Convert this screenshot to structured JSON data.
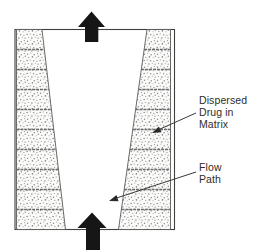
{
  "figure": {
    "labels": {
      "dispersed_drug": {
        "line1": "Dispersed",
        "line2": "Drug in",
        "line3": "Matrix"
      },
      "flow_path": {
        "line1": "Flow",
        "line2": "Path"
      }
    },
    "icons": {
      "top_arrow": "up-arrow",
      "bottom_arrow": "up-arrow",
      "dispersed_pointer": "leader-arrow",
      "flow_pointer": "leader-arrow"
    },
    "structure": {
      "matrix_bands": 2,
      "matrix_layers_per_band": 10
    },
    "colors": {
      "background": "#ffffff",
      "casing_outline": "#3f3f3f",
      "band_outline": "#5a5a5a",
      "layer_divider": "#6a6a6a",
      "stipple_dot": "#858585",
      "stipple_background": "#fbfbf9",
      "solid_arrow": "#161616",
      "text": "#2d2d2d"
    }
  }
}
